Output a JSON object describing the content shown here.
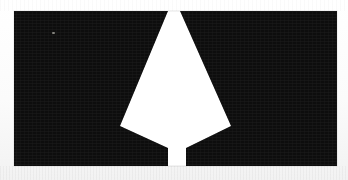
{
  "figure": {
    "caption": "",
    "width": 348,
    "height": 180,
    "background_color": "#fdfdfd",
    "ink_color": "#080808",
    "highlight_color": "#ffffff"
  },
  "chart_data": {
    "type": "scatter",
    "subtitle": "",
    "xlabel": "",
    "ylabel": "",
    "grid": false,
    "legend": "none",
    "xlim": [
      0,
      348
    ],
    "ylim": [
      0,
      180
    ],
    "regions": [
      {
        "name": "left-dark-mass",
        "fill": "#080808",
        "points": "14,11 168,11 120,126 168,148 168,166 14,166"
      },
      {
        "name": "right-dark-mass",
        "fill": "#080808",
        "points": "180,11 337,11 337,166 186,166 186,148 231,126"
      },
      {
        "name": "center-white-wedge",
        "fill": "#ffffff",
        "points": "169,11 180,11 231,126 186,148 186,166 168,166 168,148 120,126"
      }
    ],
    "measurements": {
      "image_left": 14,
      "image_right": 337,
      "image_top": 11,
      "image_bottom": 166,
      "wedge_top_width": 11,
      "wedge_widest_width": 111,
      "wedge_widest_y": 126,
      "bottom_gap_width": 18,
      "bottom_gap_y": 148
    },
    "artifacts": [
      {
        "name": "bright-speck",
        "x": 52,
        "y": 32,
        "w": 3,
        "h": 2
      }
    ]
  }
}
